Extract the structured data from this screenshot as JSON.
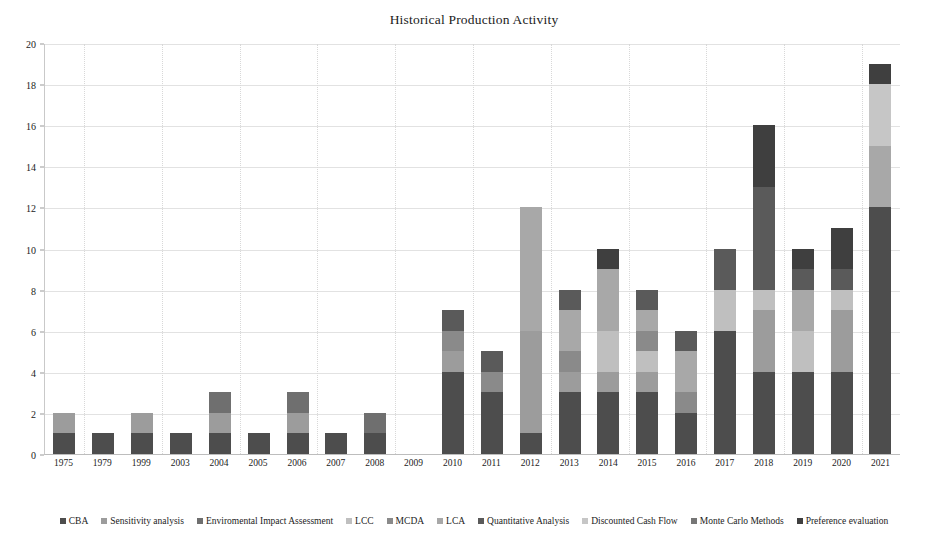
{
  "chart_data": {
    "type": "bar",
    "subtype": "stacked-bar",
    "title": "Historical Production Activity",
    "xlabel": "",
    "ylabel": "",
    "ylim": [
      0,
      20
    ],
    "ytick_step": 2,
    "yticks": [
      "0",
      "2",
      "4",
      "6",
      "8",
      "10",
      "12",
      "14",
      "16",
      "18",
      "20"
    ],
    "grid": "horizontal-solid-and-vertical-dotted",
    "legend_position": "bottom",
    "categories": [
      "1975",
      "1979",
      "1999",
      "2003",
      "2004",
      "2005",
      "2006",
      "2007",
      "2008",
      "2009",
      "2010",
      "2011",
      "2012",
      "2013",
      "2014",
      "2015",
      "2016",
      "2017",
      "2018",
      "2019",
      "2020",
      "2021"
    ],
    "totals": [
      2,
      1,
      2,
      1,
      3,
      1,
      3,
      1,
      2,
      0,
      7,
      5,
      12,
      8,
      10,
      8,
      6,
      10,
      16,
      10,
      11,
      19
    ],
    "series": [
      {
        "name": "CBA",
        "color": "#4d4d4d",
        "values": [
          1,
          1,
          1,
          1,
          1,
          1,
          1,
          1,
          1,
          0,
          4,
          3,
          1,
          3,
          3,
          3,
          2,
          6,
          4,
          4,
          4,
          12
        ]
      },
      {
        "name": "Sensitivity analysis",
        "color": "#9c9c9c",
        "values": [
          1,
          0,
          1,
          0,
          1,
          0,
          1,
          0,
          0,
          0,
          1,
          0,
          5,
          1,
          1,
          1,
          0,
          0,
          3,
          0,
          3,
          0
        ]
      },
      {
        "name": "Enviromental Impact Assessment",
        "color": "#6f6f6f",
        "values": [
          0,
          0,
          0,
          0,
          1,
          0,
          1,
          0,
          1,
          0,
          0,
          0,
          0,
          0,
          0,
          0,
          0,
          0,
          0,
          0,
          0,
          0
        ]
      },
      {
        "name": "LCC",
        "color": "#bfbfbf",
        "values": [
          0,
          0,
          0,
          0,
          0,
          0,
          0,
          0,
          0,
          0,
          0,
          0,
          0,
          0,
          2,
          1,
          0,
          2,
          1,
          2,
          1,
          0
        ]
      },
      {
        "name": "MCDA",
        "color": "#8a8a8a",
        "values": [
          0,
          0,
          0,
          0,
          0,
          0,
          0,
          0,
          0,
          0,
          1,
          1,
          0,
          1,
          0,
          1,
          1,
          0,
          0,
          0,
          0,
          0
        ]
      },
      {
        "name": "LCA",
        "color": "#a8a8a8",
        "values": [
          0,
          0,
          0,
          0,
          0,
          0,
          0,
          0,
          0,
          0,
          0,
          0,
          6,
          2,
          3,
          1,
          2,
          0,
          0,
          2,
          0,
          3
        ]
      },
      {
        "name": "Quantitative Analysis",
        "color": "#5a5a5a",
        "values": [
          0,
          0,
          0,
          0,
          0,
          0,
          0,
          0,
          0,
          0,
          1,
          1,
          0,
          1,
          0,
          1,
          1,
          2,
          5,
          1,
          1,
          0
        ]
      },
      {
        "name": "Discounted Cash Flow",
        "color": "#c6c6c6",
        "values": [
          0,
          0,
          0,
          0,
          0,
          0,
          0,
          0,
          0,
          0,
          0,
          0,
          0,
          0,
          0,
          0,
          0,
          0,
          0,
          0,
          0,
          3
        ]
      },
      {
        "name": "Monte Carlo Methods",
        "color": "#767676",
        "values": [
          0,
          0,
          0,
          0,
          0,
          0,
          0,
          0,
          0,
          0,
          0,
          0,
          0,
          0,
          0,
          0,
          0,
          0,
          0,
          0,
          0,
          0
        ]
      },
      {
        "name": "Preference evaluation",
        "color": "#3f3f3f",
        "values": [
          0,
          0,
          0,
          0,
          0,
          0,
          0,
          0,
          0,
          0,
          0,
          0,
          0,
          0,
          1,
          0,
          0,
          0,
          3,
          1,
          2,
          1
        ]
      }
    ]
  },
  "axis": {
    "y_max_label": "20",
    "y_min_label": "0"
  }
}
